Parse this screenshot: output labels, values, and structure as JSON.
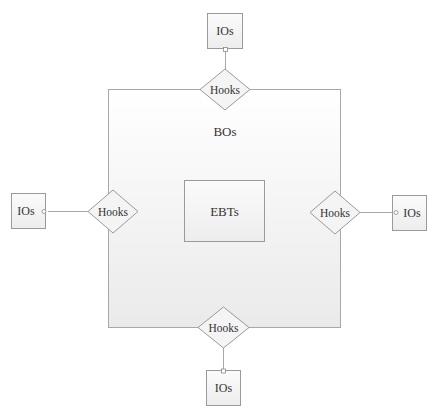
{
  "diagram": {
    "outer_container": {
      "label": "BOs"
    },
    "center_box": {
      "label": "EBTs"
    },
    "hooks": [
      {
        "position": "top",
        "label": "Hooks"
      },
      {
        "position": "left",
        "label": "Hooks"
      },
      {
        "position": "right",
        "label": "Hooks"
      },
      {
        "position": "bottom",
        "label": "Hooks"
      }
    ],
    "interface_objects": [
      {
        "position": "top",
        "label": "IOs"
      },
      {
        "position": "left",
        "label": "IOs"
      },
      {
        "position": "right",
        "label": "IOs"
      },
      {
        "position": "bottom",
        "label": "IOs"
      }
    ],
    "colors": {
      "stroke": "#a8a8a8",
      "text": "#333333",
      "fill_top": "#ffffff",
      "fill_bottom": "#ececec"
    }
  }
}
